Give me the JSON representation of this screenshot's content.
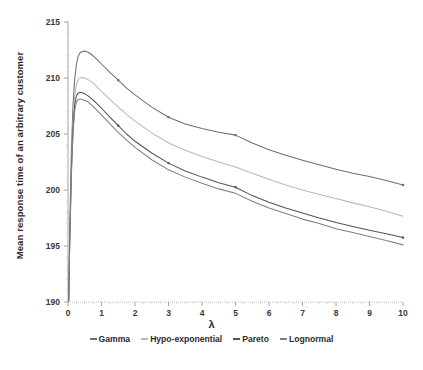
{
  "chart_data": {
    "type": "line",
    "title": "",
    "xlabel": "λ",
    "ylabel": "Mean response time of an arbitrary customer",
    "xlim": [
      0,
      10
    ],
    "ylim": [
      190,
      215
    ],
    "xticks": [
      0,
      1,
      2,
      3,
      4,
      5,
      6,
      7,
      8,
      9,
      10
    ],
    "yticks": [
      190,
      195,
      200,
      205,
      210,
      215
    ],
    "grid": false,
    "legend_position": "bottom",
    "x": [
      0.02,
      0.05,
      0.1,
      0.15,
      0.2,
      0.25,
      0.3,
      0.35,
      0.4,
      0.5,
      0.6,
      0.7,
      0.8,
      0.9,
      1.0,
      1.25,
      1.5,
      1.75,
      2.0,
      2.5,
      3.0,
      3.5,
      4.0,
      4.5,
      5.0,
      5.5,
      6.0,
      6.5,
      7.0,
      7.5,
      8.0,
      8.5,
      9.0,
      9.5,
      10.0
    ],
    "series": [
      {
        "name": "Gamma",
        "color": "#6f6f6f",
        "values": [
          190.2,
          196.4,
          203.4,
          207.6,
          209.9,
          211.2,
          211.9,
          212.2,
          212.35,
          212.4,
          212.3,
          212.1,
          211.85,
          211.55,
          211.25,
          210.5,
          209.8,
          209.1,
          208.5,
          207.4,
          206.5,
          205.9,
          205.5,
          205.15,
          204.9,
          204.2,
          203.6,
          203.1,
          202.65,
          202.25,
          201.85,
          201.5,
          201.2,
          200.85,
          200.45
        ]
      },
      {
        "name": "Hypo-exponential",
        "color": "#b8b8b8",
        "values": [
          190.15,
          195.6,
          202.1,
          206.1,
          208.4,
          209.4,
          209.85,
          210.0,
          210.05,
          210.0,
          209.85,
          209.65,
          209.4,
          209.1,
          208.8,
          208.1,
          207.4,
          206.75,
          206.15,
          205.1,
          204.2,
          203.55,
          203.0,
          202.5,
          202.05,
          201.5,
          200.95,
          200.45,
          200.0,
          199.6,
          199.25,
          198.85,
          198.5,
          198.1,
          197.65
        ]
      },
      {
        "name": "Pareto",
        "color": "#535353",
        "values": [
          190.1,
          195.2,
          201.6,
          205.6,
          207.6,
          208.4,
          208.65,
          208.7,
          208.7,
          208.6,
          208.4,
          208.15,
          207.9,
          207.6,
          207.3,
          206.5,
          205.75,
          205.0,
          204.35,
          203.3,
          202.4,
          201.7,
          201.15,
          200.65,
          200.25,
          199.5,
          198.9,
          198.4,
          197.95,
          197.5,
          197.1,
          196.75,
          196.4,
          196.1,
          195.75
        ]
      },
      {
        "name": "Lognormal",
        "color": "#808080",
        "values": [
          190.05,
          194.9,
          201.2,
          205.1,
          207.1,
          207.85,
          208.05,
          208.1,
          208.1,
          208.0,
          207.85,
          207.6,
          207.3,
          207.0,
          206.7,
          205.9,
          205.15,
          204.45,
          203.8,
          202.7,
          201.8,
          201.15,
          200.6,
          200.1,
          199.7,
          199.0,
          198.4,
          197.9,
          197.4,
          197.0,
          196.55,
          196.2,
          195.85,
          195.5,
          195.1
        ]
      }
    ]
  },
  "axis": {
    "x_tick_labels": [
      "0",
      "1",
      "2",
      "3",
      "4",
      "5",
      "6",
      "7",
      "8",
      "9",
      "10"
    ],
    "y_tick_labels": [
      "190",
      "195",
      "200",
      "205",
      "210",
      "215"
    ],
    "x_title": "λ",
    "y_title": "Mean response time of an arbitrary customer"
  },
  "legend": {
    "items": [
      {
        "label": "Gamma",
        "color": "#6f6f6f"
      },
      {
        "label": "Hypo-exponential",
        "color": "#b8b8b8"
      },
      {
        "label": "Pareto",
        "color": "#535353"
      },
      {
        "label": "Lognormal",
        "color": "#808080"
      }
    ]
  }
}
